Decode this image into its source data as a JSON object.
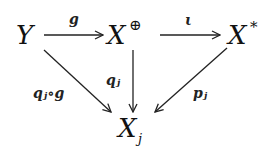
{
  "diagram": {
    "type": "commutative-diagram",
    "nodes": {
      "Y": {
        "label": "Y"
      },
      "Xoplus": {
        "label": "X",
        "sup": "⊕"
      },
      "Xstar": {
        "label": "X",
        "sup": "*"
      },
      "Xj": {
        "label": "X",
        "sub": "j"
      }
    },
    "arrows": {
      "g": {
        "from": "Y",
        "to": "Xoplus",
        "label": "g"
      },
      "iota": {
        "from": "Xoplus",
        "to": "Xstar",
        "label": "ι"
      },
      "qj_g": {
        "from": "Y",
        "to": "Xj",
        "label": "qⱼ∘g"
      },
      "qj": {
        "from": "Xoplus",
        "to": "Xj",
        "label": "qⱼ"
      },
      "pj": {
        "from": "Xstar",
        "to": "Xj",
        "label": "pⱼ"
      }
    }
  }
}
